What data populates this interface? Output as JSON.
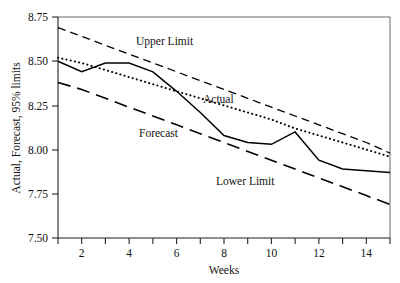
{
  "chart_data": {
    "type": "line",
    "title": "",
    "xlabel": "Weeks",
    "ylabel": "Actual, Forecast, 95% limits",
    "xlim": [
      1,
      15
    ],
    "ylim": [
      7.5,
      8.75
    ],
    "grid": false,
    "legend_position": "inline-annotations",
    "x": [
      1,
      2,
      3,
      4,
      5,
      6,
      7,
      8,
      9,
      10,
      11,
      12,
      13,
      14,
      15
    ],
    "xticks": [
      2,
      4,
      6,
      8,
      10,
      12,
      14
    ],
    "xtick_labels": [
      "2",
      "4",
      "6",
      "8",
      "10",
      "12",
      "14"
    ],
    "yticks": [
      7.5,
      7.75,
      8.0,
      8.25,
      8.5,
      8.75
    ],
    "ytick_labels": [
      "7.50",
      "7.75",
      "8.00",
      "8.25",
      "8.50",
      "8.75"
    ],
    "series": [
      {
        "name": "Actual",
        "style": "solid",
        "label": "Actual",
        "values": [
          8.5,
          8.44,
          8.49,
          8.49,
          8.44,
          8.33,
          8.21,
          8.08,
          8.04,
          8.03,
          8.1,
          7.94,
          7.89,
          7.88,
          7.87
        ]
      },
      {
        "name": "Forecast",
        "style": "dotted",
        "label": "Forecast",
        "values": [
          8.52,
          8.49,
          8.45,
          8.41,
          8.37,
          8.33,
          8.29,
          8.25,
          8.21,
          8.17,
          8.12,
          8.08,
          8.04,
          8.0,
          7.96
        ]
      },
      {
        "name": "Upper Limit",
        "style": "dashed",
        "label": "Upper Limit",
        "values": [
          8.69,
          8.64,
          8.59,
          8.54,
          8.49,
          8.44,
          8.39,
          8.34,
          8.29,
          8.24,
          8.19,
          8.14,
          8.09,
          8.04,
          7.98
        ]
      },
      {
        "name": "Lower Limit",
        "style": "long-dashed",
        "label": "Lower Limit",
        "values": [
          8.38,
          8.34,
          8.29,
          8.24,
          8.19,
          8.14,
          8.09,
          8.04,
          7.99,
          7.94,
          7.89,
          7.84,
          7.79,
          7.74,
          7.69
        ]
      }
    ],
    "annotations": [
      {
        "text": "Upper Limit",
        "x": 4.25,
        "y": 8.6
      },
      {
        "text": "Forecast",
        "x": 4.4,
        "y": 8.24
      },
      {
        "text": "Actual",
        "x": 7.2,
        "y": 8.27
      },
      {
        "text": "Lower Limit",
        "x": 8.35,
        "y": 7.87
      }
    ]
  }
}
